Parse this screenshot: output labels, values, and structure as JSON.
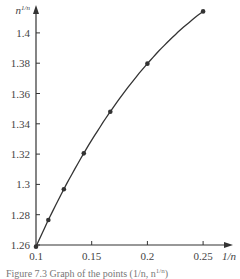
{
  "chart_data": {
    "type": "line",
    "title": "",
    "xlabel": "1/n",
    "ylabel": "n^{1/n}",
    "x_ticks": [
      "0.1",
      "0.15",
      "0.2",
      "0.25"
    ],
    "y_ticks": [
      "1.26",
      "1.28",
      "1.3",
      "1.32",
      "1.34",
      "1.36",
      "1.38",
      "1.4"
    ],
    "xlim": [
      0.1,
      0.27
    ],
    "ylim": [
      1.26,
      1.42
    ],
    "grid": false,
    "series": [
      {
        "name": "n^{1/n}",
        "x": [
          0.1,
          0.1111,
          0.125,
          0.1429,
          0.1667,
          0.2,
          0.25
        ],
        "values": [
          1.2589,
          1.2765,
          1.2968,
          1.3205,
          1.348,
          1.3797,
          1.4142
        ],
        "markers": true
      }
    ]
  },
  "labels": {
    "y_axis": "n",
    "y_axis_sup": "1/n",
    "x_axis": "1/n"
  },
  "caption": "Figure 7.3  Graph of the points (1/n, n",
  "caption_sup": "1/n",
  "caption_end": ")"
}
